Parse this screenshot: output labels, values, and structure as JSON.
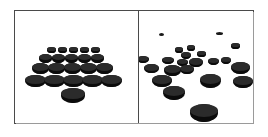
{
  "figure": {
    "type": "illustration",
    "panels": [
      {
        "id": "ordered",
        "name": "ordered-arrangement-panel",
        "layout": "regular-triangular-grid",
        "disc_count": 21,
        "discs": [
          {
            "cx": 36,
            "cy": 38,
            "w": 9,
            "h": 4
          },
          {
            "cx": 47,
            "cy": 38,
            "w": 9,
            "h": 4
          },
          {
            "cx": 58,
            "cy": 38,
            "w": 9,
            "h": 4
          },
          {
            "cx": 69,
            "cy": 38,
            "w": 9,
            "h": 4
          },
          {
            "cx": 80,
            "cy": 38,
            "w": 9,
            "h": 4
          },
          {
            "cx": 30,
            "cy": 46,
            "w": 13,
            "h": 6
          },
          {
            "cx": 43,
            "cy": 46,
            "w": 13,
            "h": 6
          },
          {
            "cx": 56,
            "cy": 46,
            "w": 13,
            "h": 6
          },
          {
            "cx": 69,
            "cy": 46,
            "w": 13,
            "h": 6
          },
          {
            "cx": 82,
            "cy": 46,
            "w": 13,
            "h": 6
          },
          {
            "cx": 25,
            "cy": 56,
            "w": 17,
            "h": 8
          },
          {
            "cx": 41,
            "cy": 56,
            "w": 17,
            "h": 8
          },
          {
            "cx": 57,
            "cy": 56,
            "w": 17,
            "h": 8
          },
          {
            "cx": 73,
            "cy": 56,
            "w": 17,
            "h": 8
          },
          {
            "cx": 89,
            "cy": 56,
            "w": 17,
            "h": 8
          },
          {
            "cx": 20,
            "cy": 68,
            "w": 21,
            "h": 9
          },
          {
            "cx": 39,
            "cy": 68,
            "w": 21,
            "h": 9
          },
          {
            "cx": 58,
            "cy": 68,
            "w": 21,
            "h": 9
          },
          {
            "cx": 77,
            "cy": 68,
            "w": 21,
            "h": 9
          },
          {
            "cx": 96,
            "cy": 68,
            "w": 21,
            "h": 9
          },
          {
            "cx": 58,
            "cy": 82,
            "w": 24,
            "h": 11
          }
        ]
      },
      {
        "id": "random",
        "name": "random-arrangement-panel",
        "layout": "scattered-random",
        "disc_count": 21,
        "discs": [
          {
            "cx": 22,
            "cy": 23,
            "w": 5,
            "h": 3
          },
          {
            "cx": 80,
            "cy": 22,
            "w": 7,
            "h": 3
          },
          {
            "cx": 40,
            "cy": 38,
            "w": 8,
            "h": 4
          },
          {
            "cx": 52,
            "cy": 36,
            "w": 8,
            "h": 4
          },
          {
            "cx": 96,
            "cy": 34,
            "w": 9,
            "h": 4
          },
          {
            "cx": 47,
            "cy": 43,
            "w": 10,
            "h": 5
          },
          {
            "cx": 62,
            "cy": 42,
            "w": 9,
            "h": 4
          },
          {
            "cx": 4,
            "cy": 47,
            "w": 12,
            "h": 5
          },
          {
            "cx": 29,
            "cy": 48,
            "w": 12,
            "h": 5
          },
          {
            "cx": 43,
            "cy": 50,
            "w": 11,
            "h": 5
          },
          {
            "cx": 74,
            "cy": 49,
            "w": 11,
            "h": 5
          },
          {
            "cx": 87,
            "cy": 48,
            "w": 10,
            "h": 5
          },
          {
            "cx": 57,
            "cy": 50,
            "w": 14,
            "h": 7
          },
          {
            "cx": 12,
            "cy": 56,
            "w": 15,
            "h": 7
          },
          {
            "cx": 33,
            "cy": 58,
            "w": 17,
            "h": 8
          },
          {
            "cx": 48,
            "cy": 57,
            "w": 14,
            "h": 7
          },
          {
            "cx": 101,
            "cy": 55,
            "w": 19,
            "h": 9
          },
          {
            "cx": 23,
            "cy": 68,
            "w": 20,
            "h": 9
          },
          {
            "cx": 71,
            "cy": 68,
            "w": 21,
            "h": 10
          },
          {
            "cx": 104,
            "cy": 69,
            "w": 20,
            "h": 9
          },
          {
            "cx": 35,
            "cy": 80,
            "w": 22,
            "h": 10
          },
          {
            "cx": 65,
            "cy": 99,
            "w": 28,
            "h": 13
          }
        ]
      }
    ],
    "colors": {
      "disc_fill": "#141414",
      "disc_top": "#2b2b2b",
      "disc_side": "#0b0b0b",
      "frame_border": "#4a4a4a",
      "frame_shadow": "#9a9a9a",
      "background": "#ffffff"
    }
  }
}
